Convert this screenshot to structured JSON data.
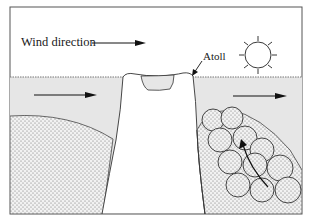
{
  "figure": {
    "labels": {
      "wind_direction": "Wind direction",
      "atoll": "Atoll"
    },
    "icons": [
      "sun-icon",
      "wind-arrow-icon",
      "current-arrow-left-icon",
      "current-arrow-right-icon",
      "growth-arrow-icon",
      "atoll-pointer-icon"
    ],
    "colors": {
      "border": "#555555",
      "water": "#e6e6e6",
      "sky": "#ffffff",
      "stipple": "#6a6a6a",
      "line": "#222222"
    }
  }
}
